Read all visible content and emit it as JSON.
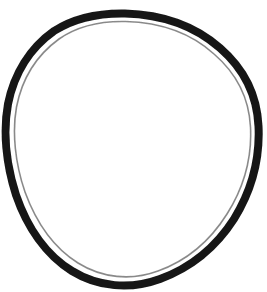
{
  "image": {
    "kind": "product-photograph",
    "subject_name": "rubber o-ring drive belt",
    "background_color": "#ffffff",
    "canvas_width": 267,
    "canvas_height": 292,
    "border": "none",
    "caption": "",
    "alt_text": "Black rubber o-ring belt on a plain white background"
  },
  "object": {
    "name": "o-ring-belt",
    "shape": "closed loop, slightly tilted oval / egg outline",
    "fill": "none (hollow interior, white)",
    "stroke_color": "#151515",
    "stroke_color_secondary": "#2b2b2b",
    "interior_color": "#ffffff",
    "band_thickness_px": 8,
    "band_thickness_min_px": 6,
    "band_thickness_max_px": 10,
    "tilt_description": "major axis runs upper-right to lower-left",
    "extents": {
      "top_y": 13,
      "bottom_y": 283,
      "left_x": 6,
      "right_x": 259,
      "top_x_at_apex": 125,
      "bottom_x_at_apex": 160,
      "left_y_at_apex": 108,
      "right_y_at_apex": 150
    },
    "center": {
      "x": 132,
      "y": 148
    },
    "outline_path": "M 125.0 13.5 C 163 14.5 196 27 220 48 C 243 68 257 95 258.5 126 C 260 157 252 190 234 219 C 216 247 190 268 160 279 C 130 290 98 287 72 271 C 46 255 27 227 16 195 C 6 164 3 131 8 104 C 14 74 30 48 54 31 C 76 17 100 13 125 13.5 Z",
    "inner_path": "M 125.5 21.5 C 161 22.5 192 34 214 54 C 236 73 249 98 250.5 127 C 252 156 244 187 227 214 C 210 241 186 261 158 271 C 131 281 102 278 78 263 C 54 248 36 222 25 192 C 15 163 12 132 16.5 107 C 22 79 37 55 59 39 C 79 25 102 21 125.5 21.5 Z"
  },
  "texture": {
    "edge_quality": "slightly rough / matte scanned rubber edge",
    "noise_opacity": 0.18
  },
  "annotations": {
    "labels": [],
    "measurements": [],
    "watermark": ""
  }
}
